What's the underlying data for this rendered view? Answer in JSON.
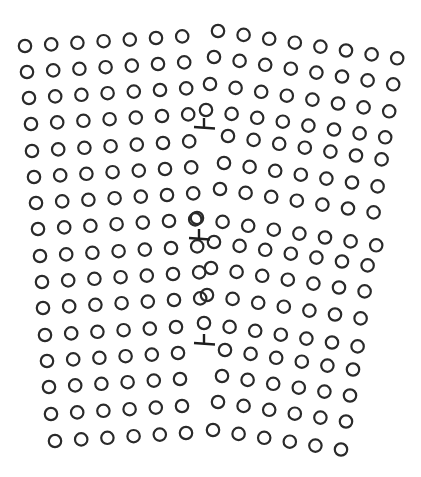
{
  "figure": {
    "background": "#ffffff",
    "atom_color": "#2a2a2a",
    "atom_radius": 6.2,
    "width": 421,
    "height": 477
  },
  "grains": [
    {
      "name": "left-grain",
      "col_vec": [
        26.2,
        -1.6
      ],
      "rows": [
        {
          "start": [
            25,
            46
          ],
          "count": 7
        },
        {
          "start": [
            27,
            72
          ],
          "count": 7
        },
        {
          "start": [
            29,
            98
          ],
          "count": 7
        },
        {
          "start": [
            31,
            124
          ],
          "count": 7
        },
        {
          "start": [
            32,
            151
          ],
          "count": 7
        },
        {
          "start": [
            34,
            177
          ],
          "count": 7
        },
        {
          "start": [
            36,
            203
          ],
          "count": 7
        },
        {
          "start": [
            38,
            229
          ],
          "count": 7
        },
        {
          "start": [
            40,
            256
          ],
          "count": 7
        },
        {
          "start": [
            42,
            282
          ],
          "count": 7
        },
        {
          "start": [
            43,
            308
          ],
          "count": 7
        },
        {
          "start": [
            45,
            335
          ],
          "count": 6
        },
        {
          "start": [
            47,
            361
          ],
          "count": 6
        },
        {
          "start": [
            49,
            387
          ],
          "count": 6
        },
        {
          "start": [
            51,
            414
          ],
          "count": 6
        },
        {
          "start": [
            55,
            441
          ],
          "count": 6
        }
      ]
    },
    {
      "name": "right-grain",
      "col_vec": [
        25.6,
        3.9
      ],
      "rows": [
        {
          "start": [
            218,
            31
          ],
          "count": 8
        },
        {
          "start": [
            214,
            57
          ],
          "count": 8
        },
        {
          "start": [
            210,
            84
          ],
          "count": 8
        },
        {
          "start": [
            206,
            110
          ],
          "count": 8
        },
        {
          "start": [
            228,
            136
          ],
          "count": 7
        },
        {
          "start": [
            224,
            163
          ],
          "count": 7
        },
        {
          "start": [
            220,
            189
          ],
          "count": 7
        },
        {
          "start": [
            197,
            218
          ],
          "count": 8
        },
        {
          "start": [
            214,
            242
          ],
          "count": 7
        },
        {
          "start": [
            211,
            268
          ],
          "count": 7
        },
        {
          "start": [
            207,
            295
          ],
          "count": 7
        },
        {
          "start": [
            204,
            323
          ],
          "count": 7
        },
        {
          "start": [
            225,
            350
          ],
          "count": 6
        },
        {
          "start": [
            222,
            376
          ],
          "count": 6
        },
        {
          "start": [
            218,
            402
          ],
          "count": 6
        },
        {
          "start": [
            213,
            430
          ],
          "count": 6
        }
      ]
    }
  ],
  "dislocations": [
    {
      "name": "edge-dislocation-1",
      "x": 204,
      "y": 127,
      "symbol": "⊥"
    },
    {
      "name": "edge-dislocation-2",
      "x": 199,
      "y": 238,
      "symbol": "⊥"
    },
    {
      "name": "edge-dislocation-3",
      "x": 204,
      "y": 343,
      "symbol": "⊥"
    }
  ]
}
